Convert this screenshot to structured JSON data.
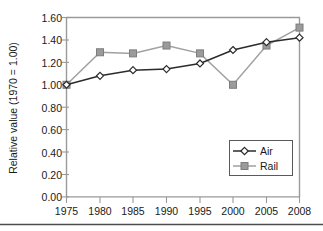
{
  "chart_data": {
    "type": "line",
    "title": "",
    "xlabel": "",
    "ylabel": "Relative value (1970 = 1.00)",
    "categories": [
      "1975",
      "1980",
      "1985",
      "1990",
      "1995",
      "2000",
      "2005",
      "2008"
    ],
    "x": [
      1975,
      1980,
      1985,
      1990,
      1995,
      2000,
      2005,
      2008
    ],
    "series": [
      {
        "name": "Air",
        "values": [
          1.0,
          1.08,
          1.13,
          1.14,
          1.19,
          1.31,
          1.38,
          1.42
        ],
        "color": "#2b2b2b",
        "marker": "open-diamond"
      },
      {
        "name": "Rail",
        "values": [
          1.0,
          1.29,
          1.28,
          1.35,
          1.28,
          1.0,
          1.35,
          1.51
        ],
        "color": "#9b9b9b",
        "marker": "filled-square"
      }
    ],
    "ylim": [
      0.0,
      1.6
    ],
    "ytick_labels": [
      "0.00",
      "0.20",
      "0.40",
      "0.60",
      "0.80",
      "1.00",
      "1.20",
      "1.40",
      "1.60"
    ],
    "ytick_values": [
      0.0,
      0.2,
      0.4,
      0.6,
      0.8,
      1.0,
      1.2,
      1.4,
      1.6
    ],
    "xtick_labels": [
      "1975",
      "1980",
      "1985",
      "1990",
      "1995",
      "2000",
      "2005",
      "2008"
    ],
    "grid": false,
    "legend_position": "lower-right",
    "legend_entries": [
      "Air",
      "Rail"
    ]
  },
  "axis": {
    "y_title": "Relative value (1970 = 1.00)"
  },
  "legend": {
    "air_label": "Air",
    "rail_label": "Rail"
  },
  "yticks": {
    "t0": "0.00",
    "t1": "0.20",
    "t2": "0.40",
    "t3": "0.60",
    "t4": "0.80",
    "t5": "1.00",
    "t6": "1.20",
    "t7": "1.40",
    "t8": "1.60"
  },
  "xticks": {
    "t0": "1975",
    "t1": "1980",
    "t2": "1985",
    "t3": "1990",
    "t4": "1995",
    "t5": "2000",
    "t6": "2005",
    "t7": "2008"
  }
}
